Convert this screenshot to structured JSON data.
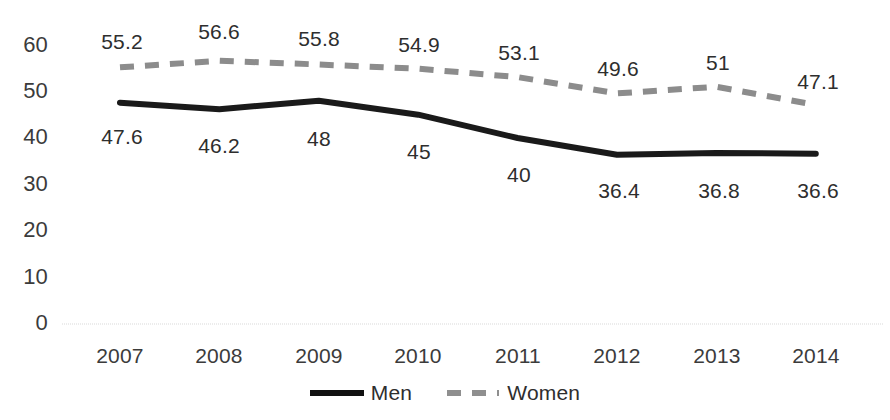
{
  "chart_data": {
    "type": "line",
    "title": "",
    "xlabel": "",
    "ylabel": "",
    "categories": [
      "2007",
      "2008",
      "2009",
      "2010",
      "2011",
      "2012",
      "2013",
      "2014"
    ],
    "series": [
      {
        "name": "Men",
        "values": [
          47.6,
          46.2,
          48,
          45,
          40,
          36.4,
          36.8,
          36.6
        ],
        "labels": [
          "47.6",
          "46.2",
          "48",
          "45",
          "40",
          "36.4",
          "36.8",
          "36.6"
        ],
        "color": "#1a1a1a",
        "style": "solid",
        "label_position": "below"
      },
      {
        "name": "Women",
        "values": [
          55.2,
          56.6,
          55.8,
          54.9,
          53.1,
          49.6,
          51,
          47.1
        ],
        "labels": [
          "55.2",
          "56.6",
          "55.8",
          "54.9",
          "53.1",
          "49.6",
          "51",
          "47.1"
        ],
        "color": "#8c8c8c",
        "style": "dashed",
        "label_position": "above"
      }
    ],
    "ylim": [
      0,
      60
    ],
    "yticks": [
      0,
      10,
      20,
      30,
      40,
      50,
      60
    ],
    "ytick_labels": [
      "0",
      "10",
      "20",
      "30",
      "40",
      "50",
      "60"
    ],
    "grid": false,
    "legend_position": "bottom-center",
    "axis_line_color": "#e3e3e3",
    "background": "#ffffff"
  },
  "legend": {
    "entries": [
      {
        "label": "Men"
      },
      {
        "label": "Women"
      }
    ]
  }
}
